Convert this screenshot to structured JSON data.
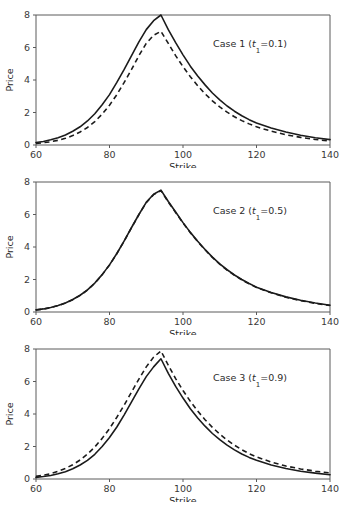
{
  "figure": {
    "background_color": "#ffffff",
    "line_color": "#1b1b1b",
    "axis_color": "#5a5a5a"
  },
  "chart_data": [
    {
      "type": "line",
      "title": "",
      "annotation": "Case 1 (t₁=0.1)",
      "annotation_case": "Case 1 (",
      "annotation_var": "t",
      "annotation_sub": "1",
      "annotation_tail": "=0.1)",
      "xlabel": "Strike",
      "ylabel": "Price",
      "xlim": [
        60,
        140
      ],
      "ylim": [
        0,
        8
      ],
      "xticks": [
        60,
        80,
        100,
        120,
        140
      ],
      "yticks": [
        0,
        2,
        4,
        6,
        8
      ],
      "xticklabels": [
        "60",
        "80",
        "100",
        "120",
        "140"
      ],
      "yticklabels": [
        "0",
        "2",
        "4",
        "6",
        "8"
      ],
      "grid": false,
      "legend": "none",
      "x": [
        60,
        62,
        64,
        66,
        68,
        70,
        72,
        74,
        76,
        78,
        80,
        82,
        84,
        86,
        88,
        90,
        92,
        94,
        96,
        98,
        100,
        102,
        104,
        106,
        108,
        110,
        112,
        114,
        116,
        118,
        120,
        124,
        128,
        132,
        136,
        140
      ],
      "series": [
        {
          "name": "solid",
          "style": "solid",
          "values": [
            0.15,
            0.22,
            0.32,
            0.45,
            0.62,
            0.85,
            1.12,
            1.48,
            1.92,
            2.48,
            3.1,
            3.85,
            4.65,
            5.5,
            6.35,
            7.1,
            7.65,
            8.0,
            7.1,
            6.3,
            5.55,
            4.85,
            4.25,
            3.7,
            3.2,
            2.78,
            2.4,
            2.08,
            1.8,
            1.56,
            1.36,
            1.05,
            0.8,
            0.6,
            0.45,
            0.33
          ]
        },
        {
          "name": "dashed",
          "style": "dashed",
          "values": [
            0.1,
            0.14,
            0.2,
            0.29,
            0.41,
            0.58,
            0.8,
            1.08,
            1.44,
            1.9,
            2.45,
            3.1,
            3.85,
            4.65,
            5.5,
            6.25,
            6.75,
            7.0,
            6.25,
            5.5,
            4.82,
            4.2,
            3.65,
            3.15,
            2.72,
            2.35,
            2.02,
            1.74,
            1.5,
            1.3,
            1.12,
            0.85,
            0.63,
            0.47,
            0.34,
            0.24
          ]
        }
      ]
    },
    {
      "type": "line",
      "title": "",
      "annotation": "Case 2 (t₁=0.5)",
      "annotation_case": "Case 2 (",
      "annotation_var": "t",
      "annotation_sub": "1",
      "annotation_tail": "=0.5)",
      "xlabel": "Strike",
      "ylabel": "Price",
      "xlim": [
        60,
        140
      ],
      "ylim": [
        0,
        8
      ],
      "xticks": [
        60,
        80,
        100,
        120,
        140
      ],
      "yticks": [
        0,
        2,
        4,
        6,
        8
      ],
      "xticklabels": [
        "60",
        "80",
        "100",
        "120",
        "140"
      ],
      "yticklabels": [
        "0",
        "2",
        "4",
        "6",
        "8"
      ],
      "grid": false,
      "legend": "none",
      "x": [
        60,
        62,
        64,
        66,
        68,
        70,
        72,
        74,
        76,
        78,
        80,
        82,
        84,
        86,
        88,
        90,
        92,
        94,
        96,
        98,
        100,
        102,
        104,
        106,
        108,
        110,
        112,
        114,
        116,
        118,
        120,
        124,
        128,
        132,
        136,
        140
      ],
      "series": [
        {
          "name": "solid",
          "style": "solid",
          "values": [
            0.13,
            0.19,
            0.28,
            0.4,
            0.56,
            0.77,
            1.03,
            1.36,
            1.78,
            2.3,
            2.9,
            3.6,
            4.38,
            5.2,
            6.0,
            6.75,
            7.25,
            7.5,
            6.8,
            6.15,
            5.5,
            4.9,
            4.35,
            3.85,
            3.38,
            2.96,
            2.6,
            2.28,
            2.0,
            1.75,
            1.53,
            1.2,
            0.93,
            0.72,
            0.55,
            0.42
          ]
        },
        {
          "name": "dashed",
          "style": "dashed",
          "values": [
            0.12,
            0.18,
            0.27,
            0.39,
            0.55,
            0.76,
            1.02,
            1.35,
            1.77,
            2.29,
            2.89,
            3.59,
            4.37,
            5.19,
            5.99,
            6.73,
            7.22,
            7.47,
            6.77,
            6.12,
            5.48,
            4.88,
            4.33,
            3.83,
            3.36,
            2.94,
            2.58,
            2.26,
            1.98,
            1.73,
            1.51,
            1.18,
            0.91,
            0.7,
            0.53,
            0.4
          ]
        }
      ]
    },
    {
      "type": "line",
      "title": "",
      "annotation": "Case 3 (t₁=0.9)",
      "annotation_case": "Case 3 (",
      "annotation_var": "t",
      "annotation_sub": "1",
      "annotation_tail": "=0.9)",
      "xlabel": "Strike",
      "ylabel": "Price",
      "xlim": [
        60,
        140
      ],
      "ylim": [
        0,
        8
      ],
      "xticks": [
        60,
        80,
        100,
        120,
        140
      ],
      "yticks": [
        0,
        2,
        4,
        6,
        8
      ],
      "xticklabels": [
        "60",
        "80",
        "100",
        "120",
        "140"
      ],
      "yticklabels": [
        "0",
        "2",
        "4",
        "6",
        "8"
      ],
      "grid": false,
      "legend": "none",
      "x": [
        60,
        62,
        64,
        66,
        68,
        70,
        72,
        74,
        76,
        78,
        80,
        82,
        84,
        86,
        88,
        90,
        92,
        94,
        96,
        98,
        100,
        102,
        104,
        106,
        108,
        110,
        112,
        114,
        116,
        118,
        120,
        124,
        128,
        132,
        136,
        140
      ],
      "series": [
        {
          "name": "solid",
          "style": "solid",
          "values": [
            0.1,
            0.15,
            0.22,
            0.32,
            0.45,
            0.63,
            0.86,
            1.15,
            1.52,
            2.0,
            2.55,
            3.2,
            3.95,
            4.75,
            5.55,
            6.3,
            6.9,
            7.4,
            6.5,
            5.7,
            4.98,
            4.32,
            3.75,
            3.25,
            2.8,
            2.42,
            2.08,
            1.79,
            1.54,
            1.33,
            1.15,
            0.86,
            0.65,
            0.48,
            0.36,
            0.26
          ]
        },
        {
          "name": "dashed",
          "style": "dashed",
          "values": [
            0.16,
            0.23,
            0.33,
            0.47,
            0.65,
            0.88,
            1.17,
            1.53,
            1.97,
            2.5,
            3.1,
            3.8,
            4.55,
            5.35,
            6.15,
            6.9,
            7.5,
            7.88,
            7.0,
            6.18,
            5.45,
            4.78,
            4.18,
            3.65,
            3.18,
            2.76,
            2.4,
            2.08,
            1.8,
            1.56,
            1.36,
            1.04,
            0.8,
            0.62,
            0.48,
            0.37
          ]
        }
      ]
    }
  ]
}
